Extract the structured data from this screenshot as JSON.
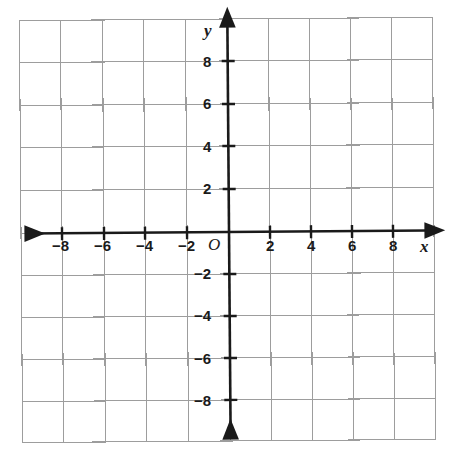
{
  "figure": {
    "kind": "cartesian-coordinate-plane",
    "background_color": "#ffffff",
    "grid_line_color": "#9a9a9a",
    "axis_color": "#1a1a1a",
    "frame_color": "#9a9a9a"
  },
  "axes": {
    "x_axis_name": "x",
    "y_axis_name": "y",
    "origin_label": "O"
  },
  "chart_data": {
    "type": "scatter",
    "title": "",
    "subtitle": "",
    "xlabel": "x",
    "ylabel": "y",
    "origin_label": "O",
    "xlim": [
      -10,
      10
    ],
    "ylim": [
      -10,
      10
    ],
    "x_tick_step": 2,
    "y_tick_step": 2,
    "grid": true,
    "grid_step": 2,
    "legend": false,
    "legend_position": "none",
    "x_tick_labels": [
      "-8",
      "-6",
      "-4",
      "-2",
      "2",
      "4",
      "6",
      "8"
    ],
    "y_tick_labels": [
      "8",
      "6",
      "4",
      "2",
      "-2",
      "-4",
      "-6",
      "-8"
    ],
    "x_ticks": [
      -8,
      -6,
      -4,
      -2,
      2,
      4,
      6,
      8
    ],
    "y_ticks": [
      8,
      6,
      4,
      2,
      -2,
      -4,
      -6,
      -8
    ],
    "series": [],
    "values": [],
    "categories": [],
    "annotations": []
  },
  "x_labels": [
    {
      "text": "-8",
      "value": -8,
      "left": 52,
      "top": 238
    },
    {
      "text": "-6",
      "value": -6,
      "left": 94,
      "top": 238
    },
    {
      "text": "-4",
      "value": -4,
      "left": 136,
      "top": 238
    },
    {
      "text": "-2",
      "value": -2,
      "left": 178,
      "top": 238
    },
    {
      "text": "2",
      "value": 2,
      "left": 266,
      "top": 238
    },
    {
      "text": "4",
      "value": 4,
      "left": 307,
      "top": 238
    },
    {
      "text": "6",
      "value": 6,
      "left": 348,
      "top": 238
    },
    {
      "text": "8",
      "value": 8,
      "left": 389,
      "top": 238
    }
  ],
  "y_labels": [
    {
      "text": "8",
      "value": 8,
      "left": 203,
      "top": 54
    },
    {
      "text": "6",
      "value": 6,
      "left": 203,
      "top": 96
    },
    {
      "text": "4",
      "value": 4,
      "left": 203,
      "top": 139
    },
    {
      "text": "2",
      "value": 2,
      "left": 203,
      "top": 181
    },
    {
      "text": "-2",
      "value": -2,
      "left": 194,
      "top": 266
    },
    {
      "text": "-4",
      "value": -4,
      "left": 194,
      "top": 308
    },
    {
      "text": "-6",
      "value": -6,
      "left": 194,
      "top": 351
    },
    {
      "text": "-8",
      "value": -8,
      "left": 194,
      "top": 393
    }
  ]
}
